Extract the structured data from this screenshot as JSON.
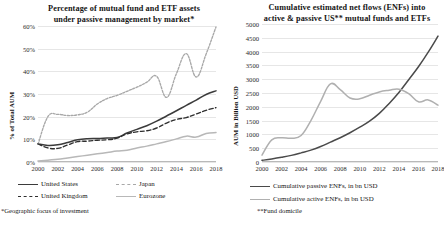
{
  "figure": {
    "width": 444,
    "height": 229,
    "background": "#ffffff"
  },
  "colors": {
    "dark": "#3b3b3b",
    "mid": "#585858",
    "light": "#b0b0b0",
    "grid": "#e6e6e6",
    "axis": "#b9b9b9",
    "text": "#141414"
  },
  "panels": [
    {
      "id": "left",
      "title": "Percentage of mutual fund and ETF assets under passive management by market*",
      "title_line1": "Percentage of mutual fund and ETF assets",
      "title_line2": "under passive management by market*",
      "ylabel": "% of Total AUM",
      "footnote": "*Geographic focus of investment",
      "yticks": [
        "0%",
        "10%",
        "20%",
        "30%",
        "40%",
        "50%",
        "60%"
      ],
      "xticks": [
        "2000",
        "2002",
        "2004",
        "2006",
        "2008",
        "2010",
        "2012",
        "2014",
        "2016",
        "2018"
      ],
      "legend": [
        {
          "label": "United States",
          "style": "solid",
          "color": "#3b3b3b"
        },
        {
          "label": "Japan",
          "style": "dotted",
          "color": "#a8a8a8"
        },
        {
          "label": "United Kingdom",
          "style": "dashed",
          "color": "#2f2f2f"
        },
        {
          "label": "Eurozone",
          "style": "solid",
          "color": "#b8b8b8"
        }
      ]
    },
    {
      "id": "right",
      "title": "Cumulative estimated net flows (ENFs) into active & passive US** mutual funds and ETFs",
      "title_line1": "Cumulative estimated net flows (ENFs) into",
      "title_line2": "active & passive US** mutual funds and ETFs",
      "ylabel": "AUM in Billion USD",
      "footnote": "**Fund domicile",
      "yticks": [
        "0",
        "500",
        "1000",
        "1500",
        "2000",
        "2500",
        "3000",
        "3500",
        "4000",
        "4500",
        "5000"
      ],
      "xticks": [
        "2000",
        "2002",
        "2004",
        "2006",
        "2008",
        "2010",
        "2012",
        "2014",
        "2016",
        "2018"
      ],
      "legend": [
        {
          "label": "Cumulative passive ENFs, in bn USD",
          "style": "solid",
          "color": "#4a4a4a"
        },
        {
          "label": "Cumulative active ENFs, in bn USD",
          "style": "solid",
          "color": "#b0b0b0"
        }
      ]
    }
  ],
  "chart_data": [
    {
      "type": "line",
      "id": "passive-share-by-market",
      "title": "Percentage of mutual fund and ETF assets under passive management by market*",
      "xlabel": "",
      "ylabel": "% of Total AUM",
      "x": [
        2000,
        2001,
        2002,
        2003,
        2004,
        2005,
        2006,
        2007,
        2008,
        2009,
        2010,
        2011,
        2012,
        2013,
        2014,
        2015,
        2016,
        2017,
        2018
      ],
      "xlim": [
        2000,
        2018
      ],
      "ylim": [
        0,
        60
      ],
      "ytick_values": [
        0,
        10,
        20,
        30,
        40,
        50,
        60
      ],
      "ytick_labels": [
        "0%",
        "10%",
        "20%",
        "30%",
        "40%",
        "50%",
        "60%"
      ],
      "xtick_values": [
        2000,
        2002,
        2004,
        2006,
        2008,
        2010,
        2012,
        2014,
        2016,
        2018
      ],
      "grid": "horizontal",
      "legend_position": "bottom",
      "units": "percent",
      "annotations": [
        "*Geographic focus of investment"
      ],
      "series": [
        {
          "name": "United States",
          "style": "solid",
          "color": "#3b3b3b",
          "values": [
            8.0,
            7.3,
            7.6,
            8.6,
            9.8,
            10.3,
            10.4,
            10.6,
            10.8,
            12.8,
            14.4,
            16.0,
            18.0,
            20.3,
            22.6,
            25.0,
            27.3,
            29.8,
            31.4
          ]
        },
        {
          "name": "Japan",
          "style": "dotted",
          "color": "#a8a8a8",
          "values": [
            7.8,
            20.0,
            21.0,
            20.5,
            20.8,
            22.0,
            25.6,
            28.0,
            29.4,
            31.2,
            33.0,
            35.2,
            37.8,
            28.5,
            39.0,
            47.8,
            37.5,
            47.6,
            59.6
          ]
        },
        {
          "name": "United Kingdom",
          "style": "dashed",
          "color": "#2f2f2f",
          "values": [
            8.0,
            6.2,
            6.0,
            7.5,
            9.0,
            9.2,
            9.6,
            9.8,
            10.5,
            12.4,
            13.3,
            13.8,
            15.0,
            17.2,
            18.8,
            19.6,
            21.2,
            22.8,
            24.0
          ]
        },
        {
          "name": "Eurozone",
          "style": "solid",
          "color": "#b8b8b8",
          "values": [
            0.4,
            0.8,
            1.2,
            1.8,
            2.4,
            3.0,
            3.6,
            4.2,
            4.8,
            5.2,
            6.2,
            7.0,
            8.0,
            9.0,
            10.2,
            11.4,
            11.0,
            12.6,
            13.0
          ]
        }
      ]
    },
    {
      "type": "line",
      "id": "cumulative-enfs-us",
      "title": "Cumulative estimated net flows (ENFs) into active & passive US** mutual funds and ETFs",
      "xlabel": "",
      "ylabel": "AUM in Billion USD",
      "x": [
        2000,
        2001,
        2002,
        2003,
        2004,
        2005,
        2006,
        2007,
        2008,
        2009,
        2010,
        2011,
        2012,
        2013,
        2014,
        2015,
        2016,
        2017,
        2018
      ],
      "xlim": [
        2000,
        2018
      ],
      "ylim": [
        0,
        5000
      ],
      "ytick_values": [
        0,
        500,
        1000,
        1500,
        2000,
        2500,
        3000,
        3500,
        4000,
        4500,
        5000
      ],
      "ytick_labels": [
        "0",
        "500",
        "1000",
        "1500",
        "2000",
        "2500",
        "3000",
        "3500",
        "4000",
        "4500",
        "5000"
      ],
      "xtick_values": [
        2000,
        2002,
        2004,
        2006,
        2008,
        2010,
        2012,
        2014,
        2016,
        2018
      ],
      "grid": "horizontal",
      "legend_position": "bottom",
      "units": "billion USD",
      "annotations": [
        "**Fund domicile"
      ],
      "series": [
        {
          "name": "Cumulative passive ENFs, in bn USD",
          "style": "solid",
          "color": "#4a4a4a",
          "values": [
            60,
            110,
            170,
            240,
            330,
            430,
            560,
            720,
            880,
            1060,
            1260,
            1480,
            1760,
            2120,
            2520,
            2980,
            3450,
            3980,
            4560
          ]
        },
        {
          "name": "Cumulative active ENFs, in bn USD",
          "style": "solid",
          "color": "#b0b0b0",
          "values": [
            250,
            800,
            880,
            860,
            960,
            1500,
            2200,
            2830,
            2620,
            2320,
            2290,
            2420,
            2540,
            2600,
            2640,
            2480,
            2180,
            2250,
            2060
          ]
        }
      ]
    }
  ]
}
